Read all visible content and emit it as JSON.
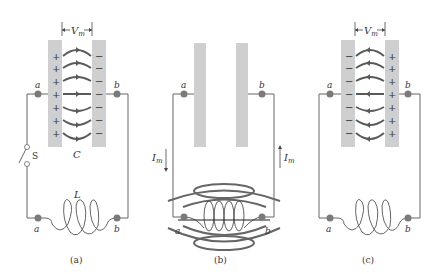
{
  "figure": {
    "panels": [
      {
        "id": "a",
        "caption": "(a)",
        "voltage_label": "V",
        "voltage_sub": "m",
        "capacitor_label": "C",
        "inductor_label": "L",
        "switch_label": "S",
        "node_left": "a",
        "node_right": "b",
        "left_plate_sign": "+",
        "right_plate_sign": "−",
        "field_direction": "left-to-right"
      },
      {
        "id": "b",
        "caption": "(b)",
        "current_label": "I",
        "current_sub": "m",
        "node_left": "a",
        "node_right": "b",
        "note": "capacitor uncharged, magnetic field around inductor"
      },
      {
        "id": "c",
        "caption": "(c)",
        "voltage_label": "V",
        "voltage_sub": "m",
        "node_left": "a",
        "node_right": "b",
        "left_plate_sign": "−",
        "right_plate_sign": "+",
        "field_direction": "right-to-left"
      }
    ],
    "colors": {
      "plate": "#cfcfcf",
      "wire": "#666666",
      "field_line": "#5a5a5a",
      "node": "#7a7a7a",
      "text": "#333333"
    }
  }
}
